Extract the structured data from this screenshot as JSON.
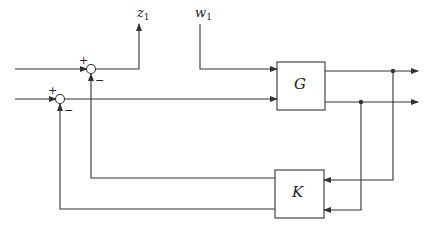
{
  "diagram": {
    "type": "block-diagram",
    "blocks": [
      {
        "id": "G",
        "label": "G"
      },
      {
        "id": "K",
        "label": "K"
      }
    ],
    "signals": {
      "z": {
        "base": "z",
        "sub": "1"
      },
      "w": {
        "base": "w",
        "sub": "1"
      }
    },
    "summing_junctions": [
      {
        "id": "sum1",
        "plus": "+",
        "minus": "−"
      },
      {
        "id": "sum2",
        "plus": "+",
        "minus": "−"
      }
    ],
    "colors": {
      "line": "#333333",
      "background": "#ffffff"
    }
  }
}
